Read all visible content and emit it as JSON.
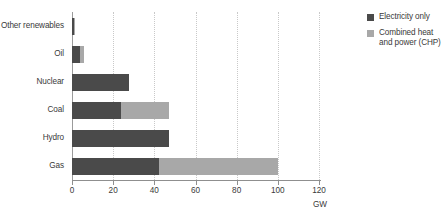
{
  "chart_data": {
    "type": "bar",
    "orientation": "horizontal",
    "stacked": true,
    "title": "",
    "subtitle": "",
    "xlabel": "GW",
    "ylabel": "",
    "xlim": [
      0,
      120
    ],
    "xticks": [
      0,
      20,
      40,
      60,
      80,
      100,
      120
    ],
    "xtick_labels": [
      "0",
      "20",
      "40",
      "60",
      "80",
      "100",
      "120"
    ],
    "grid": "vertical-dotted",
    "legend_position": "right-top",
    "categories": [
      "Other renewables",
      "Oil",
      "Nuclear",
      "Coal",
      "Hydro",
      "Gas"
    ],
    "series": [
      {
        "name": "Electricity only",
        "color": "#4a4a4a",
        "values": [
          1.0,
          4.0,
          27.5,
          24.0,
          47.0,
          42.5
        ]
      },
      {
        "name": "Combined heat and power (CHP)",
        "color": "#a8a8a8",
        "values": [
          0.4,
          2.0,
          0.0,
          23.0,
          0.0,
          57.5
        ]
      }
    ],
    "totals": [
      1.4,
      6.0,
      27.5,
      47.0,
      47.0,
      100.0
    ]
  },
  "legend": {
    "items": [
      {
        "label": "Electricity only",
        "swatch": "elec"
      },
      {
        "label": "Combined heat and power (CHP)",
        "swatch": "chp"
      }
    ]
  },
  "axis": {
    "x_title": "GW"
  }
}
